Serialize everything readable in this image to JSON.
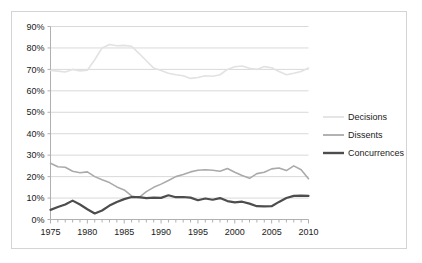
{
  "chart_data": {
    "type": "line",
    "title": "",
    "subtitle": "",
    "xlabel": "",
    "ylabel": "",
    "xlim": [
      1975,
      2010
    ],
    "ylim": [
      0,
      90
    ],
    "grid": true,
    "legend_position": "right",
    "y_ticks": [
      "0%",
      "10%",
      "20%",
      "30%",
      "40%",
      "50%",
      "60%",
      "70%",
      "80%",
      "90%"
    ],
    "y_tick_values": [
      0,
      10,
      20,
      30,
      40,
      50,
      60,
      70,
      80,
      90
    ],
    "x_ticks": [
      "1975",
      "1980",
      "1985",
      "1990",
      "1995",
      "2000",
      "2005",
      "2010"
    ],
    "x_tick_values": [
      1975,
      1980,
      1985,
      1990,
      1995,
      2000,
      2005,
      2010
    ],
    "x": [
      1975,
      1976,
      1977,
      1978,
      1979,
      1980,
      1981,
      1982,
      1983,
      1984,
      1985,
      1986,
      1987,
      1988,
      1989,
      1990,
      1991,
      1992,
      1993,
      1994,
      1995,
      1996,
      1997,
      1998,
      1999,
      2000,
      2001,
      2002,
      2003,
      2004,
      2005,
      2006,
      2007,
      2008,
      2009,
      2010
    ],
    "series": [
      {
        "name": "Decisions",
        "color": "#e2e2e2",
        "width": 1.6,
        "values": [
          69.5,
          69.2,
          68.8,
          70.0,
          69.3,
          69.6,
          74.5,
          80.0,
          81.6,
          81.0,
          81.2,
          80.8,
          77.5,
          74.0,
          70.6,
          69.5,
          68.2,
          67.5,
          67.0,
          65.8,
          66.2,
          67.0,
          66.8,
          67.5,
          70.0,
          71.2,
          71.6,
          70.5,
          70.0,
          71.3,
          70.8,
          69.0,
          67.5,
          68.2,
          69.0,
          70.6
        ]
      },
      {
        "name": "Dissents",
        "color": "#aaaaaa",
        "width": 1.6,
        "values": [
          26.2,
          24.6,
          24.4,
          22.5,
          21.8,
          22.2,
          20.0,
          18.5,
          17.2,
          15.2,
          13.8,
          11.0,
          10.2,
          13.0,
          15.0,
          16.5,
          18.2,
          20.0,
          21.0,
          22.2,
          23.0,
          23.2,
          23.0,
          22.5,
          23.8,
          22.0,
          20.5,
          19.2,
          21.4,
          22.0,
          23.6,
          24.0,
          22.8,
          25.0,
          23.2,
          19.0
        ]
      },
      {
        "name": "Concurrences",
        "color": "#4d4d4d",
        "width": 2.2,
        "values": [
          4.5,
          5.8,
          7.0,
          8.8,
          7.0,
          4.8,
          2.8,
          4.2,
          6.5,
          8.2,
          9.5,
          10.5,
          10.4,
          10.0,
          10.2,
          10.1,
          11.3,
          10.4,
          10.5,
          10.2,
          9.0,
          9.8,
          9.2,
          10.0,
          8.6,
          8.0,
          8.3,
          7.4,
          6.2,
          6.1,
          6.2,
          8.2,
          10.0,
          11.0,
          11.1,
          11.0
        ]
      }
    ],
    "legend": [
      {
        "label": "Decisions",
        "color": "#e2e2e2"
      },
      {
        "label": "Dissents",
        "color": "#aaaaaa"
      },
      {
        "label": "Concurrences",
        "color": "#4d4d4d"
      }
    ],
    "axis_color": "#b0b0b0",
    "grid_color": "#d9d9d9",
    "frame_color": "#d4d4d4",
    "plot_background": "#ffffff"
  }
}
